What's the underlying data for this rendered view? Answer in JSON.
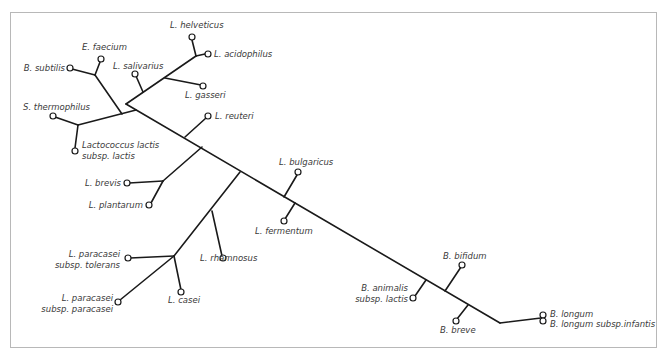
{
  "diagram": {
    "type": "unrooted phylogenetic tree",
    "line_color": "#1a1a1a",
    "frame_color": "#b8b8b8",
    "taxa": {
      "b_subtilis": "B. subtilis",
      "e_faecium": "E. faecium",
      "l_salivarius": "L. salivarius",
      "l_helveticus": "L. helveticus",
      "l_acidophilus": "L. acidophilus",
      "l_gasseri": "L. gasseri",
      "s_thermophilus": "S. thermophilus",
      "lactococcus_1": "Lactococcus lactis",
      "lactococcus_2": "subsp. lactis",
      "l_reuteri": "L. reuteri",
      "l_brevis": "L. brevis",
      "l_plantarum": "L. plantarum",
      "l_bulgaricus": "L. bulgaricus",
      "l_fermentum": "L. fermentum",
      "l_paracasei_tol_1": "L. paracasei",
      "l_paracasei_tol_2": "subsp. tolerans",
      "l_rhamnosus": "L. rhamnosus",
      "l_paracasei_par_1": "L. paracasei",
      "l_paracasei_par_2": "subsp. paracasei",
      "l_casei": "L. casei",
      "b_bifidum": "B. bifidum",
      "b_animalis_1": "B. animalis",
      "b_animalis_2": "subsp. lactis",
      "b_breve": "B. breve",
      "b_longum": "B. longum",
      "b_longum_infantis": "B. longum subsp.infantis"
    }
  }
}
